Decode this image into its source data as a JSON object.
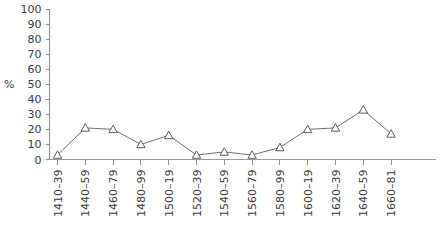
{
  "chart_data": {
    "type": "line",
    "title": "",
    "xlabel": "",
    "ylabel": "%",
    "ylim": [
      0,
      100
    ],
    "yticks": [
      0,
      10,
      20,
      30,
      40,
      50,
      60,
      70,
      80,
      90,
      100
    ],
    "grid": false,
    "legend": null,
    "marker": "open-triangle",
    "line_color": "#6f6f6f",
    "marker_edge_color": "#5c5c5c",
    "marker_face_color": "#ffffff",
    "axis_color": "#8d8d8d",
    "categories": [
      "1410–39",
      "1440–59",
      "1460–79",
      "1480–99",
      "1500–19",
      "1520–39",
      "1540–59",
      "1560–79",
      "1580–99",
      "1600–19",
      "1620–39",
      "1640–59",
      "1660–81"
    ],
    "values": [
      3,
      21,
      20,
      10,
      16,
      3,
      5,
      3,
      8,
      20,
      21,
      33,
      17
    ],
    "series": [
      {
        "name": "",
        "values": [
          3,
          21,
          20,
          10,
          16,
          3,
          5,
          3,
          8,
          20,
          21,
          33,
          17
        ]
      }
    ]
  },
  "axis": {
    "y_label": "%",
    "y_tick_labels": [
      "100",
      "90",
      "80",
      "70",
      "60",
      "50",
      "40",
      "30",
      "20",
      "10",
      "0"
    ],
    "x_tick_labels": [
      "1410–39",
      "1440–59",
      "1460–79",
      "1480–99",
      "1500–19",
      "1520–39",
      "1540–59",
      "1560–79",
      "1580–99",
      "1600–19",
      "1620–39",
      "1640–59",
      "1660–81"
    ]
  }
}
